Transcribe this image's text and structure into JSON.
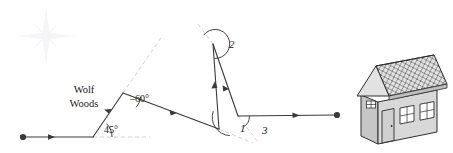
{
  "figure": {
    "background_color": "#ffffff",
    "line_color": "#3a3a3a",
    "dash_color": "#c9c9c9",
    "compass_color": "#f2f2f4"
  },
  "labels": {
    "place_line1": "Wolf",
    "place_line2": "Woods",
    "angle_minus60": "–60°",
    "angle_45": "45°",
    "angle_1": "1",
    "angle_2": "2",
    "angle_3": "3"
  },
  "path": {
    "start_marker": "filled-dot",
    "end_marker": "filled-dot",
    "vertices": [
      {
        "name": "start",
        "x": 23,
        "y": 137
      },
      {
        "name": "bend-45",
        "x": 93,
        "y": 137
      },
      {
        "name": "bend-minus60",
        "x": 123,
        "y": 93
      },
      {
        "name": "turn-vertex-low",
        "x": 219,
        "y": 129
      },
      {
        "name": "apex",
        "x": 213,
        "y": 44
      },
      {
        "name": "corner",
        "x": 238,
        "y": 116
      },
      {
        "name": "end",
        "x": 337,
        "y": 115
      }
    ]
  },
  "house": {
    "name": "house-destination",
    "wall_color": "#d6d6d6",
    "wall_shadow_color": "#b7b7b7",
    "roof_color": "#dcdcdc",
    "outline_color": "#2e2e2e",
    "window_color": "#ffffff",
    "door_color": "#cfcfcf",
    "windows_front": 2,
    "windows_gable": 1,
    "doors": 1
  },
  "compass": {
    "name": "compass-rose",
    "points": 8,
    "center_x": 46,
    "center_y": 36
  }
}
